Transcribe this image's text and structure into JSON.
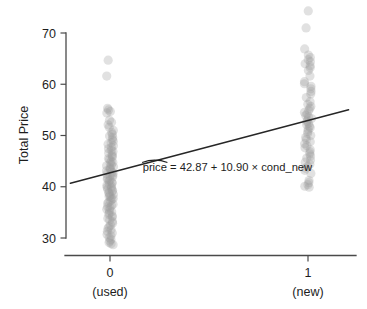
{
  "chart_data": {
    "type": "scatter",
    "title": "",
    "xlabel": "",
    "ylabel": "Total Price",
    "xlim": [
      -0.22,
      1.24
    ],
    "ylim": [
      27.0,
      75.5
    ],
    "grid": false,
    "legend": "none",
    "x_tick_values": [
      0,
      1
    ],
    "x_tick_labels": [
      "0",
      "1"
    ],
    "x_tick_sublabels": [
      "(used)",
      "(new)"
    ],
    "y_tick_values": [
      30,
      40,
      50,
      60,
      70
    ],
    "y_tick_labels": [
      "30",
      "40",
      "50",
      "60",
      "70"
    ],
    "annotation": {
      "text_hat": "price",
      "text_rest": " = 42.87 + 10.90 × cond_new",
      "full_text": "pricê = 42.87 + 10.90 × cond_new",
      "x": 0.165,
      "y": 43.0
    },
    "regression": {
      "intercept": 42.87,
      "slope": 10.9,
      "equation": "price = 42.87 + 10.90 × cond_new",
      "x_start": -0.2,
      "x_end": 1.205,
      "y_start": 40.69,
      "y_end": 55.01
    },
    "point_style": {
      "color": "#9a9a9a",
      "opacity": 0.3,
      "radius_px": 4.6,
      "jitter_x": 0.018
    },
    "series": [
      {
        "name": "cond_new = 0 (used)",
        "x": 0,
        "values": [
          64.7,
          61.6,
          55.3,
          55.0,
          54.7,
          54.4,
          53.0,
          52.6,
          52.1,
          51.6,
          51.0,
          50.6,
          50.2,
          49.9,
          49.6,
          49.2,
          48.9,
          48.6,
          48.3,
          48.0,
          47.7,
          47.4,
          47.1,
          46.9,
          46.6,
          46.3,
          46.0,
          45.8,
          45.5,
          45.3,
          45.0,
          44.8,
          44.6,
          44.3,
          44.1,
          43.9,
          43.7,
          43.5,
          43.3,
          43.1,
          42.9,
          42.7,
          42.5,
          42.3,
          42.1,
          41.9,
          41.7,
          41.5,
          41.3,
          41.1,
          40.9,
          40.7,
          40.5,
          40.3,
          40.1,
          39.9,
          39.7,
          39.5,
          39.3,
          39.1,
          38.9,
          38.7,
          38.5,
          38.3,
          38.1,
          37.9,
          37.7,
          37.5,
          37.2,
          37.0,
          36.8,
          36.6,
          36.3,
          36.1,
          35.9,
          35.6,
          35.4,
          35.1,
          34.9,
          34.6,
          34.3,
          34.1,
          33.8,
          33.5,
          33.2,
          32.9,
          32.5,
          32.2,
          31.9,
          31.6,
          31.3,
          31.0,
          30.7,
          30.4,
          30.1,
          29.7,
          29.4,
          29.1,
          28.9,
          28.7
        ]
      },
      {
        "name": "cond_new = 1 (new)",
        "x": 1,
        "values": [
          74.3,
          71.0,
          66.9,
          65.7,
          65.2,
          64.8,
          64.4,
          64.0,
          63.6,
          63.2,
          62.7,
          61.6,
          60.5,
          60.1,
          59.6,
          59.1,
          58.6,
          58.1,
          57.4,
          56.6,
          56.1,
          55.7,
          55.3,
          54.9,
          54.5,
          54.2,
          53.9,
          53.6,
          53.3,
          53.0,
          52.7,
          52.4,
          52.1,
          51.8,
          51.5,
          51.2,
          50.8,
          50.4,
          50.0,
          49.6,
          49.2,
          48.8,
          48.4,
          48.0,
          47.6,
          47.2,
          46.8,
          46.4,
          46.0,
          45.6,
          45.2,
          44.8,
          44.4,
          44.0,
          43.6,
          43.2,
          42.6,
          41.2,
          40.8,
          40.4,
          40.1,
          39.9
        ]
      }
    ]
  },
  "axes": {
    "y_title": "Total Price"
  }
}
